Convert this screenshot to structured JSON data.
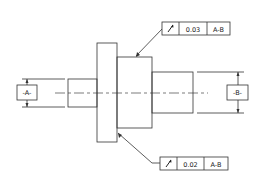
{
  "diagram": {
    "type": "gdt-drawing",
    "datums": [
      {
        "id": "datum-a",
        "label": "-A-"
      },
      {
        "id": "datum-b",
        "label": "-B-"
      }
    ],
    "feature_control_frames": [
      {
        "id": "fcf-top",
        "symbol": "circular-runout-icon",
        "symbol_glyph": "↗",
        "tolerance": "0.03",
        "datum_ref": "A-B"
      },
      {
        "id": "fcf-bottom",
        "symbol": "circular-runout-icon",
        "symbol_glyph": "↗",
        "tolerance": "0.02",
        "datum_ref": "A-B"
      }
    ],
    "colors": {
      "line": "#333333",
      "background": "#ffffff"
    }
  }
}
